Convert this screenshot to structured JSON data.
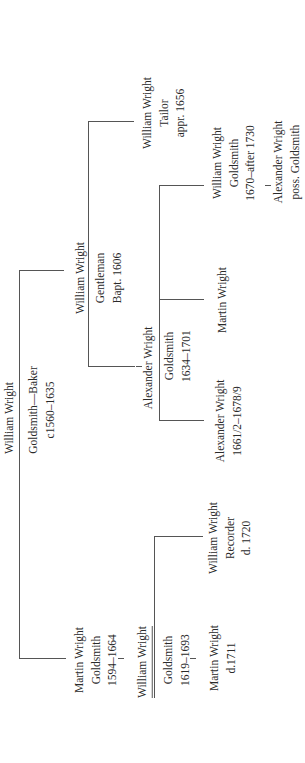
{
  "tree": {
    "root": {
      "name": "William Wright",
      "occupation": "Goldsmith—Baker",
      "dates": "c1560–1635"
    },
    "gen2_a": {
      "name": "William Wright",
      "occupation": "Gentleman",
      "dates": "Bapt. 1606"
    },
    "gen2_b": {
      "name": "Martin Wright",
      "occupation": "Goldsmith",
      "dates": "1594–1664"
    },
    "gen3_a1": {
      "name": "William Wright",
      "occupation": "Tailor",
      "dates": "appr. 1656"
    },
    "gen3_a2": {
      "name": "Alexander Wright",
      "occupation": "Goldsmith",
      "dates": "1634–1701"
    },
    "gen3_b1": {
      "name": "William Wright",
      "occupation": "Goldsmith",
      "dates": "1619–1693"
    },
    "gen4_a2_1": {
      "name": "William Wright",
      "occupation": "Goldsmith",
      "dates": "1670–after 1730"
    },
    "gen4_a2_2": {
      "name": "Martin Wright"
    },
    "gen4_a2_3": {
      "name": "Alexander Wright",
      "dates": "1661/2–1678/9"
    },
    "gen4_b1_1": {
      "name": "William Wright",
      "occupation": "Recorder",
      "dates": "d. 1720"
    },
    "gen4_b1_2": {
      "name": "Martin Wright",
      "dates": "d.1711"
    },
    "gen5": {
      "name": "Alexander Wright",
      "occupation": "poss. Goldsmith"
    }
  }
}
